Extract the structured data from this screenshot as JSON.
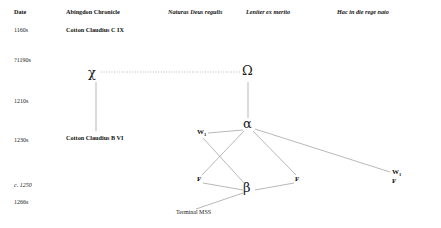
{
  "figure": {
    "type": "stemma-codicum",
    "columns": [
      {
        "id": "date",
        "label": "Date",
        "style": "bold-roman",
        "x": 14
      },
      {
        "id": "abingdon",
        "label": "Abingdon Chronicle",
        "style": "bold-roman",
        "x": 66
      },
      {
        "id": "naturas",
        "label": "Naturas Deus regulis",
        "style": "bold-italic",
        "x": 168
      },
      {
        "id": "leniter",
        "label": "Leniter ex merito",
        "style": "bold-italic",
        "x": 246
      },
      {
        "id": "hac",
        "label": "Hac in die rege nato",
        "style": "bold-italic",
        "x": 337
      }
    ],
    "dates": [
      {
        "label": "1160s",
        "y": 27
      },
      {
        "label": "?1190s",
        "y": 57
      },
      {
        "label": "1210s",
        "y": 98
      },
      {
        "label": "1230s",
        "y": 137
      },
      {
        "label": "c. 1250",
        "y": 182
      },
      {
        "label": "1266s",
        "y": 199
      }
    ],
    "nodes": [
      {
        "id": "cc-c-ix",
        "label": "Cotton Claudius C IX",
        "kind": "manuscript",
        "x": 66,
        "y": 27
      },
      {
        "id": "chi",
        "label": "χ",
        "kind": "archetype",
        "x": 92,
        "y": 76
      },
      {
        "id": "omega",
        "label": "Ω",
        "kind": "archetype",
        "x": 247,
        "y": 76
      },
      {
        "id": "alpha",
        "label": "α",
        "kind": "archetype",
        "x": 247,
        "y": 125
      },
      {
        "id": "cc-b-vi",
        "label": "Cotton Claudius B VI",
        "kind": "manuscript",
        "x": 66,
        "y": 137
      },
      {
        "id": "w-left",
        "letter": "W",
        "subscript": "1",
        "kind": "witness",
        "x": 197,
        "y": 133
      },
      {
        "id": "f-left",
        "letter": "F",
        "subscript": "",
        "kind": "witness",
        "x": 197,
        "y": 180
      },
      {
        "id": "beta",
        "label": "β",
        "kind": "archetype",
        "x": 248,
        "y": 189
      },
      {
        "id": "f-mid",
        "letter": "F",
        "subscript": "",
        "kind": "witness",
        "x": 297,
        "y": 180
      },
      {
        "id": "w-right",
        "letter": "W",
        "subscript": "1",
        "kind": "witness",
        "x": 394,
        "y": 173
      },
      {
        "id": "f-right",
        "letter": "F",
        "subscript": "",
        "kind": "witness",
        "x": 394,
        "y": 182
      },
      {
        "id": "terminal",
        "label": "Terminal MSS",
        "kind": "note",
        "x": 176,
        "y": 212
      }
    ],
    "edges": [
      {
        "from": "chi",
        "to": "omega",
        "style": "dotted"
      },
      {
        "from": "chi",
        "to": "cc-b-vi",
        "style": "solid"
      },
      {
        "from": "omega",
        "to": "alpha",
        "style": "solid"
      },
      {
        "from": "alpha",
        "to": "w-left",
        "style": "solid"
      },
      {
        "from": "alpha",
        "to": "f-left",
        "style": "solid"
      },
      {
        "from": "alpha",
        "to": "f-mid",
        "style": "solid"
      },
      {
        "from": "alpha",
        "to": "w-right",
        "style": "solid"
      },
      {
        "from": "w-left",
        "to": "beta",
        "style": "solid"
      },
      {
        "from": "f-left",
        "to": "beta",
        "style": "solid"
      },
      {
        "from": "f-mid",
        "to": "beta",
        "style": "solid"
      },
      {
        "from": "beta",
        "to": "terminal",
        "style": "solid"
      }
    ],
    "colors": {
      "background": "#ffffff",
      "text": "#1a1a1a",
      "line": "#8a8a8a"
    }
  }
}
